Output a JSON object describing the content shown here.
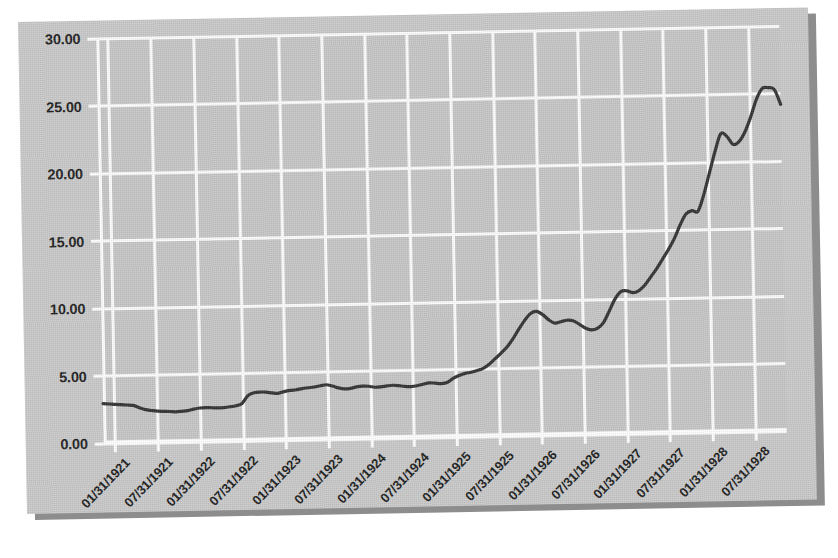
{
  "figure": {
    "background_color": "#ffffff",
    "card_color": "#c9c9c9",
    "shadow_color": "#8d8d8d",
    "plot_background_color": "#c6c6c6",
    "grid_color": "#ffffff",
    "line_color": "#323232"
  },
  "chart_data": {
    "type": "line",
    "title": "",
    "subtitle": "",
    "xlabel": "",
    "ylabel": "",
    "ylim": [
      0.0,
      30.0
    ],
    "yticks": [
      0.0,
      5.0,
      10.0,
      15.0,
      20.0,
      25.0,
      30.0
    ],
    "ytick_labels": [
      "0.00",
      "5.00",
      "10.00",
      "15.00",
      "20.00",
      "25.00",
      "30.00"
    ],
    "grid": true,
    "legend": null,
    "legend_position": "none",
    "xtick_labels": [
      "01/31/1921",
      "07/31/1921",
      "01/31/1922",
      "07/31/1922",
      "01/31/1923",
      "07/31/1923",
      "01/31/1924",
      "07/31/1924",
      "01/31/1925",
      "07/31/1925",
      "01/31/1926",
      "07/31/1926",
      "01/31/1927",
      "07/31/1927",
      "01/31/1928",
      "07/31/1928"
    ],
    "series": [
      {
        "name": "index",
        "color": "#323232",
        "x": [
          "01/31/1921",
          "02/28/1921",
          "03/31/1921",
          "04/30/1921",
          "05/31/1921",
          "06/30/1921",
          "07/31/1921",
          "08/31/1921",
          "09/30/1921",
          "10/31/1921",
          "11/30/1921",
          "12/31/1921",
          "01/31/1922",
          "02/28/1922",
          "03/31/1922",
          "04/30/1922",
          "05/31/1922",
          "06/30/1922",
          "07/31/1922",
          "08/31/1922",
          "09/30/1922",
          "10/31/1922",
          "11/30/1922",
          "12/31/1922",
          "01/31/1923",
          "02/28/1923",
          "03/31/1923",
          "04/30/1923",
          "05/31/1923",
          "06/30/1923",
          "07/31/1923",
          "08/31/1923",
          "09/30/1923",
          "10/31/1923",
          "11/30/1923",
          "12/31/1923",
          "01/31/1924",
          "02/29/1924",
          "03/31/1924",
          "04/30/1924",
          "05/31/1924",
          "06/30/1924",
          "07/31/1924",
          "08/31/1924",
          "09/30/1924",
          "10/31/1924",
          "11/30/1924",
          "12/31/1924",
          "01/31/1925",
          "02/28/1925",
          "03/31/1925",
          "04/30/1925",
          "05/31/1925",
          "06/30/1925",
          "07/31/1925",
          "08/31/1925",
          "09/30/1925",
          "10/31/1925",
          "11/30/1925",
          "12/31/1925",
          "01/31/1926",
          "02/28/1926",
          "03/31/1926",
          "04/30/1926",
          "05/31/1926",
          "06/30/1926",
          "07/31/1926",
          "08/31/1926",
          "09/30/1926",
          "10/31/1926",
          "11/30/1926",
          "12/31/1926",
          "01/31/1927",
          "02/28/1927",
          "03/31/1927",
          "04/30/1927",
          "05/31/1927",
          "06/30/1927",
          "07/31/1927",
          "08/31/1927",
          "09/30/1927",
          "10/31/1927",
          "11/30/1927",
          "12/31/1927",
          "01/31/1928",
          "02/29/1928",
          "03/31/1928",
          "04/30/1928",
          "05/31/1928",
          "06/30/1928",
          "07/31/1928",
          "08/31/1928",
          "09/30/1928",
          "10/31/1928"
        ],
        "values": [
          2.95,
          2.92,
          2.88,
          2.85,
          2.82,
          2.78,
          2.6,
          2.45,
          2.38,
          2.32,
          2.3,
          2.28,
          2.25,
          2.28,
          2.32,
          2.42,
          2.5,
          2.52,
          2.5,
          2.48,
          2.5,
          2.55,
          2.62,
          2.78,
          3.35,
          3.55,
          3.6,
          3.58,
          3.52,
          3.48,
          3.6,
          3.68,
          3.72,
          3.8,
          3.85,
          3.9,
          3.98,
          4.05,
          3.95,
          3.8,
          3.72,
          3.75,
          3.85,
          3.9,
          3.88,
          3.8,
          3.82,
          3.88,
          3.92,
          3.88,
          3.82,
          3.8,
          3.85,
          3.95,
          4.05,
          4.02,
          3.98,
          4.05,
          4.35,
          4.55,
          4.7,
          4.78,
          4.9,
          5.05,
          5.35,
          5.75,
          6.15,
          6.6,
          7.2,
          7.9,
          8.55,
          9.05,
          9.2,
          8.95,
          8.55,
          8.3,
          8.4,
          8.5,
          8.45,
          8.2,
          7.9,
          7.75,
          7.85,
          8.25,
          9.1,
          10.0,
          10.55,
          10.6,
          10.45,
          10.6,
          11.0,
          11.6,
          12.2,
          12.9
        ]
      }
    ],
    "series_extended_note": "continues to end of plot",
    "values_tail": [
      13.6,
      14.4,
      15.4,
      16.2,
      16.45,
      16.4,
      17.6,
      19.2,
      20.8,
      22.1,
      21.9,
      21.3,
      21.5,
      22.2,
      23.3,
      24.6,
      25.4,
      25.45,
      25.3,
      24.2
    ],
    "annotations": []
  }
}
